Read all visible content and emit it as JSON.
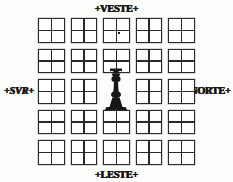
{
  "plan": {
    "title": "Colonial Town Grid Plan",
    "grid": {
      "rows": 5,
      "columns": 5,
      "block_label": "city-block",
      "blocks": [
        {
          "row": 1,
          "col": 1,
          "quadrants": 4,
          "mark": false
        },
        {
          "row": 1,
          "col": 2,
          "quadrants": 4,
          "mark": false
        },
        {
          "row": 1,
          "col": 3,
          "quadrants": 4,
          "mark": true
        },
        {
          "row": 1,
          "col": 4,
          "quadrants": 4,
          "mark": false
        },
        {
          "row": 1,
          "col": 5,
          "quadrants": 4,
          "mark": false
        },
        {
          "row": 2,
          "col": 1,
          "quadrants": 4,
          "mark": false
        },
        {
          "row": 2,
          "col": 2,
          "quadrants": 4,
          "mark": false
        },
        {
          "row": 2,
          "col": 3,
          "quadrants": 4,
          "mark": false
        },
        {
          "row": 2,
          "col": 4,
          "quadrants": 4,
          "mark": false
        },
        {
          "row": 2,
          "col": 5,
          "quadrants": 4,
          "mark": false
        },
        {
          "row": 3,
          "col": 1,
          "quadrants": 4,
          "mark": false
        },
        {
          "row": 3,
          "col": 2,
          "quadrants": 4,
          "mark": false
        },
        {
          "row": 3,
          "col": 3,
          "quadrants": 0,
          "mark": false,
          "is_plaza": true
        },
        {
          "row": 3,
          "col": 4,
          "quadrants": 4,
          "mark": false
        },
        {
          "row": 3,
          "col": 5,
          "quadrants": 4,
          "mark": false
        },
        {
          "row": 4,
          "col": 1,
          "quadrants": 4,
          "mark": false
        },
        {
          "row": 4,
          "col": 2,
          "quadrants": 4,
          "mark": false
        },
        {
          "row": 4,
          "col": 3,
          "quadrants": 4,
          "mark": false
        },
        {
          "row": 4,
          "col": 4,
          "quadrants": 4,
          "mark": false
        },
        {
          "row": 4,
          "col": 5,
          "quadrants": 4,
          "mark": false
        },
        {
          "row": 5,
          "col": 1,
          "quadrants": 4,
          "mark": false
        },
        {
          "row": 5,
          "col": 2,
          "quadrants": 4,
          "mark": false
        },
        {
          "row": 5,
          "col": 3,
          "quadrants": 4,
          "mark": false
        },
        {
          "row": 5,
          "col": 4,
          "quadrants": 4,
          "mark": false
        },
        {
          "row": 5,
          "col": 5,
          "quadrants": 4,
          "mark": false
        }
      ]
    },
    "center": {
      "feature": "monument-column",
      "description": "central plaza monument"
    },
    "directions": {
      "top": "+VESTE+",
      "bottom": "+LESTE+",
      "left": "+SVR+",
      "right": "+NORTE+"
    },
    "colors": {
      "ink": "#2b2826",
      "paper": "#fdfdfc",
      "monument": "#191715"
    }
  }
}
